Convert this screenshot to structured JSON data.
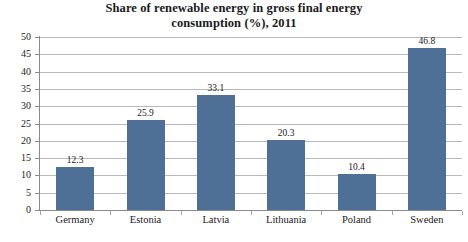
{
  "chart_data": {
    "type": "bar",
    "title": "Share of renewable energy in gross final energy consumption (%), 2011",
    "title_line1": "Share of renewable energy in gross final energy",
    "title_line2": "consumption (%), 2011",
    "xlabel": "",
    "ylabel": "",
    "categories": [
      "Germany",
      "Estonia",
      "Latvia",
      "Lithuania",
      "Poland",
      "Sweden"
    ],
    "values": [
      12.3,
      25.9,
      33.1,
      20.3,
      10.4,
      46.8
    ],
    "value_labels": [
      "12.3",
      "25.9",
      "33.1",
      "20.3",
      "10.4",
      "46.8"
    ],
    "ylim": [
      0,
      50
    ],
    "ytick_step": 5,
    "ytick_labels": [
      "50",
      "45",
      "40",
      "35",
      "30",
      "25",
      "20",
      "15",
      "10",
      "5",
      "0"
    ],
    "ytick_values": [
      50,
      45,
      40,
      35,
      30,
      25,
      20,
      15,
      10,
      5,
      0
    ],
    "grid": true,
    "grid_orientation": "horizontal",
    "legend": false,
    "legend_position": "none",
    "series": [
      {
        "name": "Share of renewable energy (%)",
        "color": "#4f7096",
        "values": [
          12.3,
          25.9,
          33.1,
          20.3,
          10.4,
          46.8
        ]
      }
    ],
    "colors": {
      "bar": "#4f7096",
      "grid": "#b9b9b9",
      "axis": "#8a8a8a",
      "text": "#1a1a1a",
      "background": "#ffffff"
    }
  }
}
